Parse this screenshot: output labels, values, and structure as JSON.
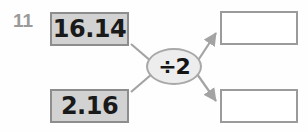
{
  "worksheet": {
    "question_number": "11",
    "type": "function-machine",
    "operator": {
      "label": "÷2",
      "symbol": "divide-by-two"
    },
    "inputs": [
      {
        "value": "16.14"
      },
      {
        "value": "2.16"
      }
    ],
    "outputs": [
      {
        "value": ""
      },
      {
        "value": ""
      }
    ],
    "colors": {
      "background": "#fefefe",
      "input_fill": "#d2d2d2",
      "input_border": "#8d8d8d",
      "output_fill": "#ffffff",
      "output_border": "#9b9b9b",
      "operator_fill": "#ededed",
      "operator_border": "#a8a8a8",
      "connector": "#a3a3a3",
      "number_label": "#9a9a9a",
      "text": "#1a1a1a"
    }
  }
}
